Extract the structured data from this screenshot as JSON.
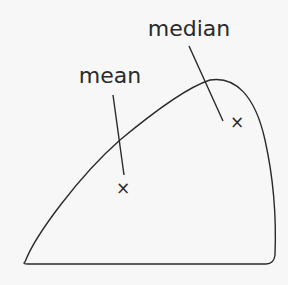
{
  "diagram": {
    "type": "skewed-distribution",
    "labels": {
      "mean": "mean",
      "median": "median"
    },
    "markers": {
      "mean_symbol": "×",
      "median_symbol": "×"
    }
  }
}
